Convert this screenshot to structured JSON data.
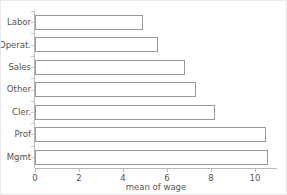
{
  "chart_data": {
    "type": "bar",
    "orientation": "horizontal",
    "title": "",
    "xlabel": "mean of wage",
    "ylabel": "",
    "categories": [
      "Labor",
      "Operat.",
      "Sales",
      "Other",
      "Cler.",
      "Prof",
      "Mgmt"
    ],
    "values": [
      4.9,
      5.6,
      6.8,
      7.3,
      8.2,
      10.5,
      10.6
    ],
    "xlim": [
      0,
      11
    ],
    "ylim": null,
    "xticks": [
      0,
      2,
      4,
      6,
      8,
      10
    ],
    "xtick_labels": [
      "0",
      "2",
      "4",
      "6",
      "8",
      "10"
    ],
    "grid": false,
    "legend": null,
    "legend_position": "none",
    "bar_fill": "#ffffff",
    "bar_edge": "#999999",
    "axis_color": "#b9b9b9",
    "text_color": "#555555",
    "background": "#ffffff",
    "annotations": []
  },
  "figure": {
    "axis_title_x": "mean of wage"
  }
}
